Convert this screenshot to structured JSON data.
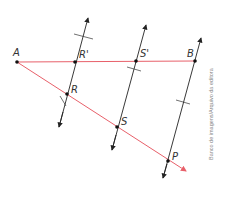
{
  "diagram": {
    "colors": {
      "segment": "#e8606a",
      "line": "#222222",
      "point": "#111111",
      "label": "#333333",
      "credit": "#888888"
    },
    "points": {
      "A": {
        "label": "A",
        "x": 17,
        "y": 62
      },
      "R_prime": {
        "label": "R'",
        "x": 75,
        "y": 62
      },
      "S_prime": {
        "label": "S'",
        "x": 136,
        "y": 61
      },
      "B": {
        "label": "B",
        "x": 195,
        "y": 61
      },
      "R": {
        "label": "R",
        "x": 67,
        "y": 94
      },
      "S": {
        "label": "S",
        "x": 117,
        "y": 127
      },
      "P": {
        "label": "P",
        "x": 168,
        "y": 161
      }
    },
    "segment_AB": "red horizontal segment from A to B",
    "ray_AP": "red ray from A through R and S to P, with arrowhead",
    "parallel_lines": [
      "line through R' and R",
      "line through S' and S",
      "line through B and P"
    ],
    "credit": "Banco de imagens/Arquivo da editora"
  }
}
